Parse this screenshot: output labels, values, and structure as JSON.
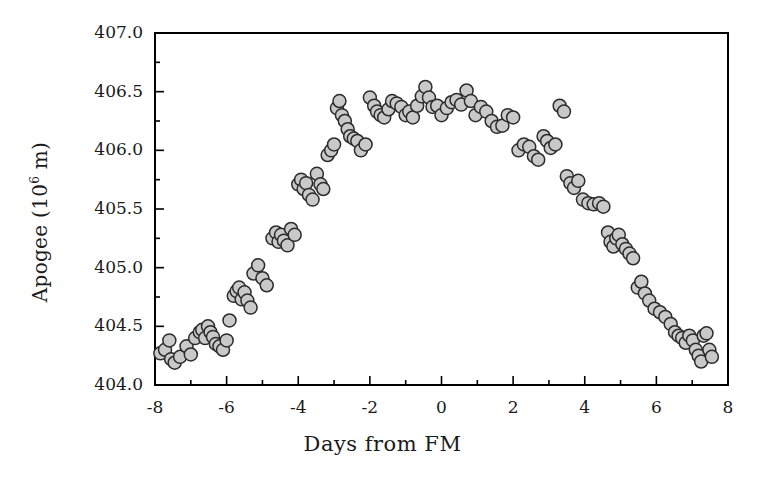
{
  "chart_data": {
    "type": "scatter",
    "title": "",
    "xlabel": "Days from FM",
    "ylabel_text": "Apogee (10",
    "ylabel_sup": "6",
    "ylabel_tail": " m)",
    "ylabel_plain": "Apogee (10^6 m)",
    "xlim": [
      -8,
      8
    ],
    "ylim": [
      404.0,
      407.0
    ],
    "xticks": [
      -8,
      -6,
      -4,
      -2,
      0,
      2,
      4,
      6,
      8
    ],
    "xtick_labels": [
      "-8",
      "-6",
      "-4",
      "-2",
      "0",
      "2",
      "4",
      "6",
      "8"
    ],
    "yticks": [
      404.0,
      404.5,
      405.0,
      405.5,
      406.0,
      406.5,
      407.0
    ],
    "ytick_labels": [
      "404.0",
      "404.5",
      "405.0",
      "405.5",
      "406.0",
      "406.5",
      "407.0"
    ],
    "x_minor_tick_interval": 1,
    "y_minor_tick_interval": 0.25,
    "grid": false,
    "legend": null,
    "marker": {
      "shape": "circle",
      "fill_color": "#c9c9c9",
      "edge_color": "#2b2b2b",
      "size_px": 13,
      "edge_width_px": 1.5
    },
    "frame": {
      "color": "#000000",
      "width_px": 2,
      "box": true
    },
    "points": [
      [
        -7.85,
        404.27
      ],
      [
        -7.72,
        404.3
      ],
      [
        -7.6,
        404.38
      ],
      [
        -7.55,
        404.22
      ],
      [
        -7.45,
        404.19
      ],
      [
        -7.3,
        404.24
      ],
      [
        -7.12,
        404.33
      ],
      [
        -7.0,
        404.26
      ],
      [
        -6.88,
        404.4
      ],
      [
        -6.75,
        404.45
      ],
      [
        -6.68,
        404.47
      ],
      [
        -6.6,
        404.4
      ],
      [
        -6.52,
        404.5
      ],
      [
        -6.45,
        404.45
      ],
      [
        -6.38,
        404.41
      ],
      [
        -6.3,
        404.35
      ],
      [
        -6.2,
        404.33
      ],
      [
        -6.1,
        404.3
      ],
      [
        -6.0,
        404.38
      ],
      [
        -5.92,
        404.55
      ],
      [
        -5.8,
        404.76
      ],
      [
        -5.72,
        404.8
      ],
      [
        -5.65,
        404.83
      ],
      [
        -5.58,
        404.73
      ],
      [
        -5.5,
        404.79
      ],
      [
        -5.42,
        404.72
      ],
      [
        -5.33,
        404.66
      ],
      [
        -5.25,
        404.95
      ],
      [
        -5.12,
        405.02
      ],
      [
        -5.0,
        404.91
      ],
      [
        -4.88,
        404.85
      ],
      [
        -4.72,
        405.25
      ],
      [
        -4.62,
        405.3
      ],
      [
        -4.55,
        405.22
      ],
      [
        -4.48,
        405.28
      ],
      [
        -4.4,
        405.23
      ],
      [
        -4.3,
        405.19
      ],
      [
        -4.2,
        405.33
      ],
      [
        -4.1,
        405.28
      ],
      [
        -4.0,
        405.71
      ],
      [
        -3.92,
        405.75
      ],
      [
        -3.85,
        405.67
      ],
      [
        -3.78,
        405.72
      ],
      [
        -3.7,
        405.62
      ],
      [
        -3.6,
        405.58
      ],
      [
        -3.48,
        405.8
      ],
      [
        -3.38,
        405.71
      ],
      [
        -3.3,
        405.67
      ],
      [
        -3.18,
        405.96
      ],
      [
        -3.08,
        406.0
      ],
      [
        -3.0,
        406.05
      ],
      [
        -2.92,
        406.36
      ],
      [
        -2.85,
        406.42
      ],
      [
        -2.78,
        406.3
      ],
      [
        -2.7,
        406.25
      ],
      [
        -2.62,
        406.18
      ],
      [
        -2.55,
        406.12
      ],
      [
        -2.45,
        406.1
      ],
      [
        -2.35,
        406.08
      ],
      [
        -2.25,
        406.0
      ],
      [
        -2.12,
        406.05
      ],
      [
        -2.0,
        406.45
      ],
      [
        -1.88,
        406.38
      ],
      [
        -1.8,
        406.33
      ],
      [
        -1.7,
        406.3
      ],
      [
        -1.6,
        406.28
      ],
      [
        -1.48,
        406.35
      ],
      [
        -1.38,
        406.42
      ],
      [
        -1.25,
        406.4
      ],
      [
        -1.12,
        406.37
      ],
      [
        -1.0,
        406.3
      ],
      [
        -0.9,
        406.33
      ],
      [
        -0.8,
        406.28
      ],
      [
        -0.68,
        406.38
      ],
      [
        -0.55,
        406.46
      ],
      [
        -0.45,
        406.54
      ],
      [
        -0.35,
        406.45
      ],
      [
        -0.25,
        406.37
      ],
      [
        -0.12,
        406.38
      ],
      [
        0.0,
        406.3
      ],
      [
        0.15,
        406.36
      ],
      [
        0.28,
        406.41
      ],
      [
        0.42,
        406.43
      ],
      [
        0.55,
        406.39
      ],
      [
        0.7,
        406.51
      ],
      [
        0.82,
        406.42
      ],
      [
        0.95,
        406.3
      ],
      [
        1.1,
        406.37
      ],
      [
        1.25,
        406.33
      ],
      [
        1.4,
        406.25
      ],
      [
        1.55,
        406.2
      ],
      [
        1.7,
        406.21
      ],
      [
        1.85,
        406.3
      ],
      [
        2.0,
        406.28
      ],
      [
        2.15,
        406.0
      ],
      [
        2.3,
        406.05
      ],
      [
        2.45,
        406.03
      ],
      [
        2.58,
        405.95
      ],
      [
        2.7,
        405.92
      ],
      [
        2.85,
        406.12
      ],
      [
        2.95,
        406.08
      ],
      [
        3.05,
        406.02
      ],
      [
        3.18,
        406.05
      ],
      [
        3.3,
        406.38
      ],
      [
        3.42,
        406.33
      ],
      [
        3.5,
        405.78
      ],
      [
        3.6,
        405.72
      ],
      [
        3.7,
        405.68
      ],
      [
        3.82,
        405.74
      ],
      [
        3.95,
        405.58
      ],
      [
        4.1,
        405.55
      ],
      [
        4.25,
        405.54
      ],
      [
        4.4,
        405.55
      ],
      [
        4.52,
        405.52
      ],
      [
        4.65,
        405.3
      ],
      [
        4.72,
        405.22
      ],
      [
        4.8,
        405.18
      ],
      [
        4.88,
        405.25
      ],
      [
        4.95,
        405.28
      ],
      [
        5.05,
        405.2
      ],
      [
        5.15,
        405.16
      ],
      [
        5.25,
        405.12
      ],
      [
        5.35,
        405.08
      ],
      [
        5.48,
        404.83
      ],
      [
        5.58,
        404.88
      ],
      [
        5.68,
        404.78
      ],
      [
        5.8,
        404.72
      ],
      [
        5.95,
        404.65
      ],
      [
        6.1,
        404.62
      ],
      [
        6.25,
        404.58
      ],
      [
        6.4,
        404.52
      ],
      [
        6.52,
        404.45
      ],
      [
        6.62,
        404.42
      ],
      [
        6.72,
        404.4
      ],
      [
        6.82,
        404.36
      ],
      [
        6.92,
        404.42
      ],
      [
        7.02,
        404.38
      ],
      [
        7.1,
        404.3
      ],
      [
        7.18,
        404.25
      ],
      [
        7.25,
        404.2
      ],
      [
        7.32,
        404.42
      ],
      [
        7.4,
        404.44
      ],
      [
        7.48,
        404.3
      ],
      [
        7.55,
        404.24
      ]
    ]
  }
}
